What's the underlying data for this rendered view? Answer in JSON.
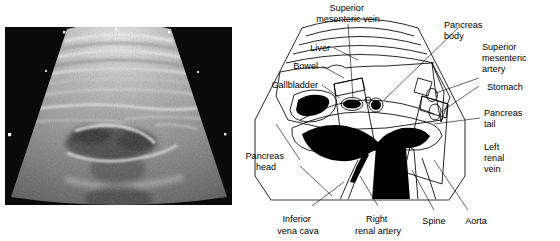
{
  "figure": {
    "type": "medical-ultrasound-with-annotated-line-diagram",
    "modality": "abdominal ultrasound",
    "view": "transverse sector scan of the upper abdomen / pancreas"
  },
  "ultrasound": {
    "name": "abdominal-ultrasound-sector-scan",
    "background_color": "#0a0a0a",
    "tissue_color_light": "#d8d8d8",
    "tissue_color_mid": "#8e8e8e",
    "tissue_color_dark": "#2a2a2a",
    "marker_color": "#ffffff",
    "description": "Grayscale sector (fan) image with speckle texture; curved subcutaneous fascial bands near the apex and hypoechoic vascular structures centrally."
  },
  "diagram": {
    "name": "pancreas-anatomy-key-diagram",
    "fill_liver": "#b9b9b9",
    "fill_pale": "#dedede",
    "fill_white": "#ffffff",
    "fill_black": "#000000",
    "outline_color": "#000000",
    "labels": [
      {
        "id": "superior-mesenteric-vein",
        "lines": [
          "Superior",
          "mesenteric vein"
        ],
        "anchor": "top"
      },
      {
        "id": "pancreas-body",
        "lines": [
          "Pancreas",
          "body"
        ],
        "anchor": "top-right"
      },
      {
        "id": "superior-mesenteric-artery",
        "lines": [
          "Superior",
          "mesenteric",
          "artery"
        ],
        "anchor": "right"
      },
      {
        "id": "stomach",
        "lines": [
          "Stomach"
        ],
        "anchor": "right"
      },
      {
        "id": "pancreas-tail",
        "lines": [
          "Pancreas",
          "tail"
        ],
        "anchor": "right"
      },
      {
        "id": "left-renal-vein",
        "lines": [
          "Left",
          "renal",
          "vein"
        ],
        "anchor": "right"
      },
      {
        "id": "liver",
        "lines": [
          "Liver"
        ],
        "anchor": "left"
      },
      {
        "id": "bowel",
        "lines": [
          "Bowel"
        ],
        "anchor": "left"
      },
      {
        "id": "gallbladder",
        "lines": [
          "Gallbladder"
        ],
        "anchor": "left"
      },
      {
        "id": "pancreas-head",
        "lines": [
          "Pancreas",
          "head"
        ],
        "anchor": "left"
      },
      {
        "id": "inferior-vena-cava",
        "lines": [
          "Inferior",
          "vena cava"
        ],
        "anchor": "bottom"
      },
      {
        "id": "right-renal-artery",
        "lines": [
          "Right",
          "renal artery"
        ],
        "anchor": "bottom"
      },
      {
        "id": "spine",
        "lines": [
          "Spine"
        ],
        "anchor": "bottom"
      },
      {
        "id": "aorta",
        "lines": [
          "Aorta"
        ],
        "anchor": "bottom"
      }
    ]
  }
}
